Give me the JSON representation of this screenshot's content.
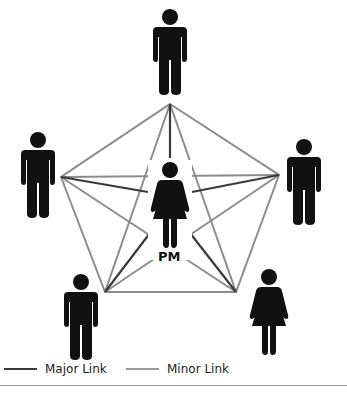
{
  "diagram": {
    "center_label": "PM",
    "colors": {
      "major": "#3a3a3a",
      "minor": "#8c8c8c",
      "figure": "#111111"
    },
    "nodes": [
      {
        "id": "top",
        "figure": "man"
      },
      {
        "id": "left",
        "figure": "man"
      },
      {
        "id": "right",
        "figure": "man"
      },
      {
        "id": "bottom-left",
        "figure": "man"
      },
      {
        "id": "bottom-right",
        "figure": "woman"
      },
      {
        "id": "center",
        "figure": "woman",
        "label": "PM"
      }
    ]
  },
  "legend": {
    "major_label": "Major Link",
    "minor_label": "Minor Link"
  }
}
